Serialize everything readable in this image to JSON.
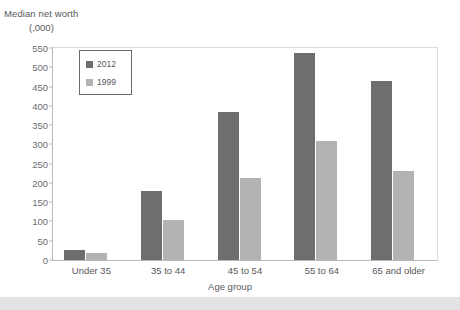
{
  "chart_data": {
    "type": "bar",
    "title": "",
    "ylabel": "Median net worth",
    "yunit": "(,000)",
    "xlabel": "Age group",
    "categories": [
      "Under 35",
      "35 to 44",
      "45 to 54",
      "55 to 64",
      "65 and older"
    ],
    "series": [
      {
        "name": "2012",
        "color": "#6e6e6e",
        "values": [
          25,
          180,
          383,
          537,
          465
        ]
      },
      {
        "name": "1999",
        "color": "#b3b3b3",
        "values": [
          18,
          105,
          212,
          310,
          232
        ]
      }
    ],
    "ylim": [
      0,
      550
    ],
    "ytick_step": 50,
    "yticks": [
      550,
      500,
      450,
      400,
      350,
      300,
      250,
      200,
      150,
      100,
      50,
      0
    ],
    "ytick_labels": [
      "550",
      "500",
      "450",
      "400",
      "350",
      "300",
      "250",
      "200",
      "150",
      "100",
      "50",
      "0"
    ],
    "grid": false,
    "legend_position": "top-left-inside",
    "legend_entries": [
      "2012",
      "1999"
    ]
  },
  "colors": {
    "series_2012": "#6e6e6e",
    "series_1999": "#b3b3b3",
    "axis": "#b8b8b8",
    "text": "#58585a",
    "bottom_band": "#e3e3e5"
  }
}
